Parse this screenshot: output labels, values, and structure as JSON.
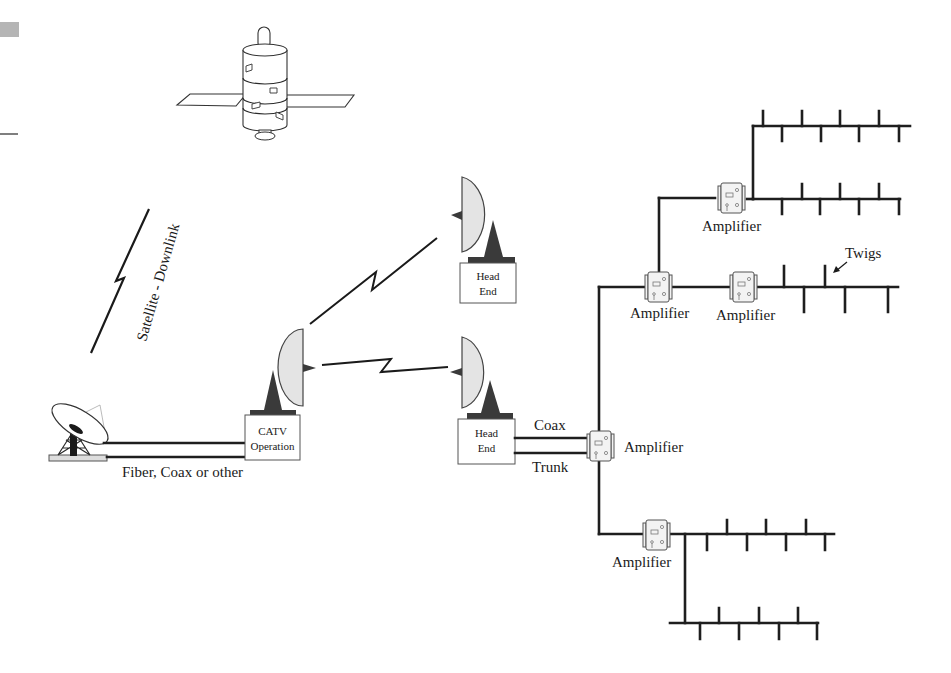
{
  "diagram": {
    "satellite_label": "Satellite - Downlink",
    "ground_link_label": "Fiber, Coax or other",
    "catv": {
      "line1": "CATV",
      "line2": "Operation"
    },
    "head_end_1": {
      "line1": "Head",
      "line2": "End"
    },
    "head_end_2": {
      "line1": "Head",
      "line2": "End"
    },
    "coax_label": "Coax",
    "trunk_label": "Trunk",
    "twigs_label": "Twigs",
    "amplifiers": [
      {
        "id": "amp-trunk",
        "label": "Amplifier"
      },
      {
        "id": "amp-branch-1",
        "label": "Amplifier"
      },
      {
        "id": "amp-branch-2",
        "label": "Amplifier"
      },
      {
        "id": "amp-upper",
        "label": "Amplifier"
      },
      {
        "id": "amp-lower",
        "label": "Amplifier"
      }
    ],
    "icons": {
      "satellite": "satellite-icon",
      "ground_dish": "ground-station-dish-icon",
      "microwave_dish": "microwave-dish-icon",
      "lightning": "radio-link-bolt-icon",
      "amplifier": "amplifier-icon"
    },
    "colors": {
      "line": "#1e1e1e",
      "dish_fill": "#e4e4e4",
      "pedestal": "#3a3a3a"
    }
  }
}
